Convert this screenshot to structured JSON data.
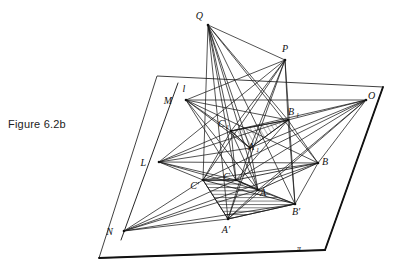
{
  "caption": {
    "text": "Figure 6.2b"
  },
  "figure": {
    "title": "Figure 6.2b",
    "colors": {
      "background": "#ffffff",
      "line": "#1a1a1a",
      "plane_edge": "#333333",
      "hatch": "#333333",
      "label": "#111111"
    },
    "plane": {
      "name": "pi",
      "label": "π",
      "label_pos": {
        "x": 299,
        "y": 250
      },
      "corners": [
        {
          "x": 157,
          "y": 76
        },
        {
          "x": 383,
          "y": 87
        },
        {
          "x": 325,
          "y": 250
        },
        {
          "x": 99,
          "y": 258
        }
      ]
    },
    "points": [
      {
        "id": "Q",
        "label": "Q",
        "x": 208,
        "y": 25,
        "lx": 203,
        "ly": 19,
        "base": "Q",
        "sub": ""
      },
      {
        "id": "P",
        "label": "P",
        "x": 285,
        "y": 60,
        "lx": 285,
        "ly": 52,
        "base": "P",
        "sub": ""
      },
      {
        "id": "O",
        "label": "O",
        "x": 366,
        "y": 100,
        "lx": 368,
        "ly": 96,
        "base": "O",
        "sub": ""
      },
      {
        "id": "M",
        "label": "M",
        "x": 186,
        "y": 100,
        "lx": 172,
        "ly": 103,
        "base": "M",
        "sub": ""
      },
      {
        "id": "L",
        "label": "L",
        "x": 159,
        "y": 162,
        "lx": 145,
        "ly": 165,
        "base": "L",
        "sub": ""
      },
      {
        "id": "N",
        "label": "N",
        "x": 124,
        "y": 231,
        "lx": 113,
        "ly": 234,
        "base": "N",
        "sub": ""
      },
      {
        "id": "B1",
        "label": "B₁",
        "x": 288,
        "y": 120,
        "lx": 289,
        "ly": 114,
        "base": "B",
        "sub": "1"
      },
      {
        "id": "C1",
        "label": "C₁",
        "x": 231,
        "y": 131,
        "lx": 219,
        "ly": 125,
        "base": "C",
        "sub": "1"
      },
      {
        "id": "A1",
        "label": "A₁",
        "x": 250,
        "y": 148,
        "lx": 249,
        "ly": 147,
        "base": "A",
        "sub": "1"
      },
      {
        "id": "B",
        "label": "B",
        "x": 318,
        "y": 163,
        "lx": 322,
        "ly": 163,
        "base": "B",
        "sub": ""
      },
      {
        "id": "C",
        "label": "C",
        "x": 236,
        "y": 180,
        "lx": 229,
        "ly": 179,
        "base": "C",
        "sub": ""
      },
      {
        "id": "A",
        "label": "A",
        "x": 258,
        "y": 190,
        "lx": 259,
        "ly": 192,
        "base": "A",
        "sub": ""
      },
      {
        "id": "Cp",
        "label": "C′",
        "x": 203,
        "y": 180,
        "lx": 196,
        "ly": 188,
        "base": "C",
        "sub": ""
      },
      {
        "id": "Ap",
        "label": "A′",
        "x": 228,
        "y": 219,
        "lx": 221,
        "ly": 231,
        "base": "A",
        "sub": ""
      },
      {
        "id": "Bp",
        "label": "B′",
        "x": 295,
        "y": 204,
        "lx": 290,
        "ly": 213,
        "base": "B",
        "sub": ""
      }
    ],
    "line_l": {
      "label": "l",
      "label_pos": {
        "x": 184,
        "y": 90
      },
      "from": {
        "x": 178,
        "y": 83
      },
      "to": {
        "x": 121,
        "y": 240
      }
    },
    "shaded_regions": [
      {
        "name": "upper-triangle-C1A1B1",
        "hatch": "diagonal",
        "vertices": [
          [
            231,
            131
          ],
          [
            250,
            148
          ],
          [
            288,
            120
          ]
        ]
      },
      {
        "name": "lower-quad-CpCABp-Ap",
        "hatch": "horizontal",
        "vertices": [
          [
            203,
            180
          ],
          [
            236,
            180
          ],
          [
            258,
            190
          ],
          [
            295,
            204
          ],
          [
            228,
            219
          ]
        ]
      }
    ]
  }
}
